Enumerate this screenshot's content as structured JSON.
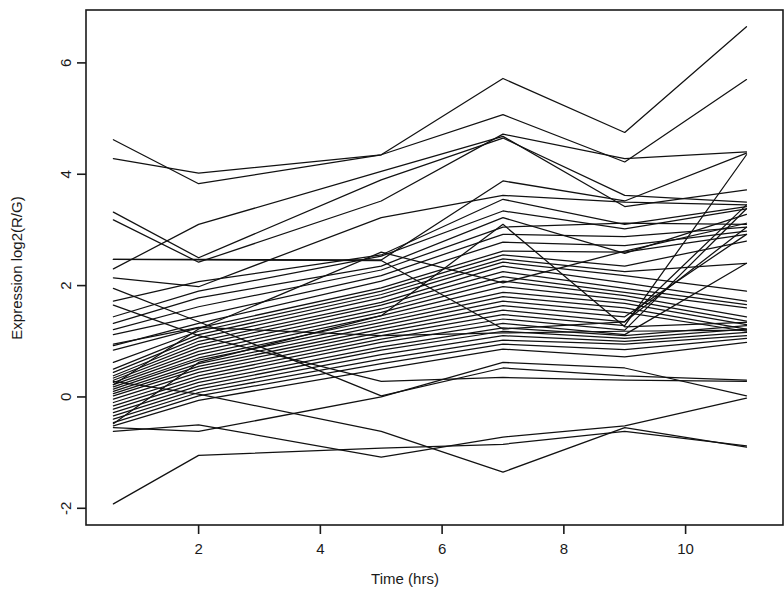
{
  "figure": {
    "name": "expression-time-course-spaghetti-plot",
    "background_color": "#ffffff",
    "line_color": "#111111",
    "axis_color": "#1a1a1a"
  },
  "chart_data": {
    "type": "line",
    "title": "",
    "xlabel": "Time (hrs)",
    "ylabel": "Expression log2(R/G)",
    "xlim": [
      0.15,
      11.6
    ],
    "ylim": [
      -2.3,
      6.95
    ],
    "xticks": [
      2,
      4,
      6,
      8,
      10
    ],
    "xtick_labels": [
      "2",
      "4",
      "6",
      "8",
      "10"
    ],
    "yticks": [
      -2,
      0,
      2,
      4,
      6
    ],
    "ytick_labels": [
      "-2",
      "0",
      "2",
      "4",
      "6"
    ],
    "grid": false,
    "legend": "none",
    "x": [
      0.6,
      2,
      5,
      7,
      9,
      11
    ],
    "series": [
      {
        "name": "g1",
        "values": [
          4.62,
          3.83,
          4.35,
          5.72,
          4.75,
          6.65
        ]
      },
      {
        "name": "g2",
        "values": [
          4.28,
          4.02,
          4.35,
          5.07,
          4.22,
          5.7
        ]
      },
      {
        "name": "g3",
        "values": [
          3.18,
          2.42,
          3.52,
          4.72,
          4.28,
          4.4
        ]
      },
      {
        "name": "g4",
        "values": [
          2.47,
          2.47,
          2.46,
          3.88,
          3.52,
          4.38
        ]
      },
      {
        "name": "g5",
        "values": [
          2.3,
          3.1,
          4.05,
          4.68,
          3.42,
          3.72
        ]
      },
      {
        "name": "g6",
        "values": [
          2.14,
          1.98,
          3.22,
          3.62,
          3.5,
          3.45
        ]
      },
      {
        "name": "g7",
        "values": [
          1.72,
          2.07,
          2.55,
          3.55,
          3.1,
          3.42
        ]
      },
      {
        "name": "g8",
        "values": [
          1.44,
          1.9,
          2.53,
          3.34,
          3.02,
          3.38
        ]
      },
      {
        "name": "g9",
        "values": [
          1.32,
          1.78,
          2.35,
          3.22,
          2.58,
          3.28
        ]
      },
      {
        "name": "g10",
        "values": [
          1.21,
          1.62,
          2.28,
          3.05,
          3.12,
          3.1
        ]
      },
      {
        "name": "g11",
        "values": [
          1.12,
          1.45,
          2.18,
          2.92,
          2.88,
          3.05
        ]
      },
      {
        "name": "g12",
        "values": [
          0.92,
          1.32,
          2.08,
          2.78,
          2.72,
          2.98
        ]
      },
      {
        "name": "g13",
        "values": [
          0.84,
          1.24,
          1.96,
          2.62,
          2.6,
          2.92
        ]
      },
      {
        "name": "g14",
        "values": [
          0.62,
          1.18,
          1.9,
          2.55,
          2.35,
          2.8
        ]
      },
      {
        "name": "g15",
        "values": [
          0.5,
          1.12,
          1.84,
          2.48,
          2.25,
          2.4
        ]
      },
      {
        "name": "g16",
        "values": [
          0.44,
          1.06,
          1.78,
          2.42,
          2.18,
          1.9
        ]
      },
      {
        "name": "g17",
        "values": [
          0.38,
          1.0,
          1.7,
          2.35,
          2.05,
          1.72
        ]
      },
      {
        "name": "g18",
        "values": [
          0.34,
          0.94,
          1.65,
          2.25,
          1.95,
          1.66
        ]
      },
      {
        "name": "g19",
        "values": [
          0.3,
          0.88,
          1.58,
          2.16,
          1.88,
          1.6
        ]
      },
      {
        "name": "g20",
        "values": [
          0.26,
          0.82,
          1.52,
          2.08,
          1.82,
          1.44
        ]
      },
      {
        "name": "g21",
        "values": [
          0.22,
          0.76,
          1.46,
          1.98,
          1.75,
          1.36
        ]
      },
      {
        "name": "g22",
        "values": [
          0.18,
          0.7,
          1.4,
          1.88,
          1.68,
          1.3
        ]
      },
      {
        "name": "g23",
        "values": [
          0.14,
          0.66,
          1.34,
          1.8,
          1.6,
          1.22
        ]
      },
      {
        "name": "g24",
        "values": [
          0.1,
          0.6,
          1.28,
          1.72,
          1.52,
          1.18
        ]
      },
      {
        "name": "g25",
        "values": [
          0.06,
          0.55,
          1.22,
          1.64,
          1.44,
          2.92
        ]
      },
      {
        "name": "g26",
        "values": [
          0.02,
          0.5,
          1.16,
          1.56,
          1.35,
          3.05
        ]
      },
      {
        "name": "g27",
        "values": [
          -0.04,
          0.44,
          1.1,
          1.48,
          1.28,
          4.35
        ]
      },
      {
        "name": "g28",
        "values": [
          -0.1,
          0.38,
          1.04,
          1.4,
          1.2,
          3.38
        ]
      },
      {
        "name": "g29",
        "values": [
          -0.16,
          0.32,
          0.98,
          1.32,
          1.12,
          2.4
        ]
      },
      {
        "name": "g30",
        "values": [
          -0.22,
          0.26,
          0.9,
          1.24,
          1.1,
          1.28
        ]
      },
      {
        "name": "g31",
        "values": [
          -0.28,
          0.2,
          0.84,
          1.18,
          1.05,
          1.22
        ]
      },
      {
        "name": "g32",
        "values": [
          -0.34,
          0.14,
          0.76,
          1.1,
          1.0,
          1.16
        ]
      },
      {
        "name": "g33",
        "values": [
          -0.4,
          0.08,
          0.68,
          1.02,
          0.95,
          1.1
        ]
      },
      {
        "name": "g34",
        "values": [
          -0.46,
          0.02,
          0.6,
          0.95,
          0.85,
          1.05
        ]
      },
      {
        "name": "g35",
        "values": [
          -0.52,
          -0.06,
          0.5,
          0.86,
          0.72,
          0.98
        ]
      },
      {
        "name": "g36",
        "values": [
          0.95,
          1.25,
          1.1,
          1.15,
          1.18,
          1.2
        ]
      },
      {
        "name": "g37",
        "values": [
          2.47,
          2.46,
          2.45,
          1.22,
          1.35,
          3.45
        ]
      },
      {
        "name": "g38",
        "values": [
          1.95,
          1.35,
          0.02,
          0.52,
          0.38,
          0.3
        ]
      },
      {
        "name": "g39",
        "values": [
          1.65,
          1.1,
          0.28,
          0.35,
          0.3,
          0.28
        ]
      },
      {
        "name": "g40",
        "values": [
          -0.55,
          -0.62,
          0.0,
          0.62,
          0.52,
          0.02
        ]
      },
      {
        "name": "g41",
        "values": [
          -0.62,
          -0.5,
          -1.08,
          -0.72,
          -0.52,
          -0.02
        ]
      },
      {
        "name": "g42",
        "values": [
          0.28,
          0.05,
          -0.62,
          -1.35,
          -0.55,
          -0.9
        ]
      },
      {
        "name": "g43",
        "values": [
          -1.92,
          -1.05,
          -0.92,
          -0.85,
          -0.62,
          -0.88
        ]
      },
      {
        "name": "g44",
        "values": [
          3.32,
          2.5,
          3.9,
          4.65,
          3.62,
          3.5
        ]
      },
      {
        "name": "g45",
        "values": [
          0.22,
          1.22,
          2.6,
          2.05,
          2.62,
          3.12
        ]
      },
      {
        "name": "g46",
        "values": [
          -0.48,
          0.62,
          1.46,
          3.1,
          1.26,
          1.34
        ]
      }
    ]
  }
}
